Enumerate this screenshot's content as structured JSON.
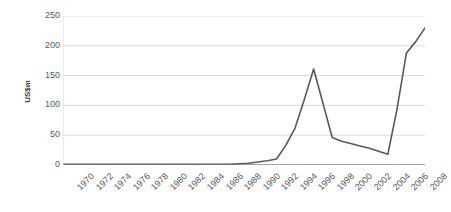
{
  "chart_data": {
    "type": "line",
    "title": "",
    "subtitle": "",
    "xlabel": "",
    "ylabel": "US$m",
    "ylim": [
      0,
      250
    ],
    "yticks": [
      0,
      50,
      100,
      150,
      200,
      250
    ],
    "ytick_labels": [
      "0",
      "50",
      "100",
      "150",
      "200",
      "250"
    ],
    "grid": true,
    "grid_axis": "y",
    "legend": false,
    "legend_position": "none",
    "xlim": [
      1970,
      2009
    ],
    "xtick_labels": [
      "1970",
      "1972",
      "1974",
      "1976",
      "1978",
      "1980",
      "1982",
      "1984",
      "1986",
      "1988",
      "1990",
      "1992",
      "1994",
      "1996",
      "1998",
      "2000",
      "2002",
      "2004",
      "2006",
      "2008"
    ],
    "xticks": [
      1970,
      1972,
      1974,
      1976,
      1978,
      1980,
      1982,
      1984,
      1986,
      1988,
      1990,
      1992,
      1994,
      1996,
      1998,
      2000,
      2002,
      2004,
      2006,
      2008
    ],
    "xtick_rotation": -45,
    "x": [
      1970,
      1971,
      1972,
      1973,
      1974,
      1975,
      1976,
      1977,
      1978,
      1979,
      1980,
      1981,
      1982,
      1983,
      1984,
      1985,
      1986,
      1987,
      1988,
      1989,
      1990,
      1991,
      1992,
      1993,
      1994,
      1995,
      1996,
      1997,
      1998,
      1999,
      2000,
      2001,
      2002,
      2003,
      2004,
      2005,
      2006,
      2007,
      2008,
      2009
    ],
    "values": [
      1,
      1,
      1,
      1,
      1,
      1,
      1,
      1,
      1,
      1,
      1,
      1,
      1,
      1,
      1,
      1,
      1,
      1,
      1,
      2,
      3,
      5,
      7,
      10,
      33,
      62,
      110,
      161,
      104,
      46,
      40,
      36,
      32,
      28,
      23,
      18,
      95,
      188,
      207,
      230
    ],
    "series": [
      {
        "name": "US$m",
        "color": "#595959",
        "line_width": 1.6,
        "markers": false,
        "values": [
          1,
          1,
          1,
          1,
          1,
          1,
          1,
          1,
          1,
          1,
          1,
          1,
          1,
          1,
          1,
          1,
          1,
          1,
          1,
          2,
          3,
          5,
          7,
          10,
          33,
          62,
          110,
          161,
          104,
          46,
          40,
          36,
          32,
          28,
          23,
          18,
          95,
          188,
          207,
          230
        ]
      }
    ],
    "annotations": [],
    "colors": {
      "line": "#595959",
      "grid": "#d9d9d9",
      "axis": "#858585",
      "text": "#595959",
      "axis_title": "#404040",
      "background": "#ffffff"
    }
  }
}
